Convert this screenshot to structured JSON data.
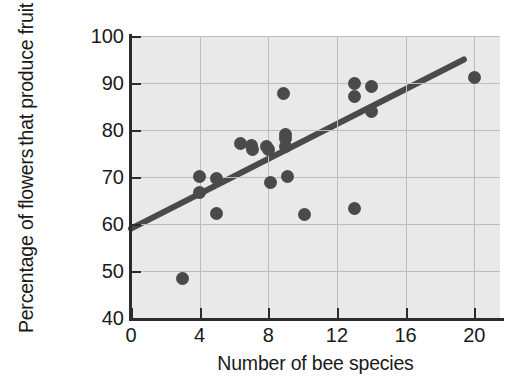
{
  "chart_data": {
    "type": "scatter",
    "title": "",
    "xlabel": "Number of bee species",
    "ylabel_line1": "Percentage of flowers",
    "ylabel_line2": "that produce fruit",
    "xlim": [
      0,
      21.5
    ],
    "ylim": [
      40,
      100
    ],
    "xticks": [
      0,
      4,
      8,
      12,
      16,
      20
    ],
    "yticks": [
      40,
      50,
      60,
      70,
      80,
      90,
      100
    ],
    "xtick_labels": [
      "0",
      "4",
      "8",
      "12",
      "16",
      "20"
    ],
    "ytick_labels": [
      "40",
      "50",
      "60",
      "70",
      "80",
      "90",
      "100"
    ],
    "grid": true,
    "legend": "none",
    "marker_color": "#4a4a4a",
    "plot_background": "#e9e9e9",
    "gridline_color": "#bdbdbd",
    "axis_color": "#2b2b2b",
    "trendline_color": "#4a4a4a",
    "points": [
      {
        "x": 3.0,
        "y": 48.5
      },
      {
        "x": 4.0,
        "y": 70.2
      },
      {
        "x": 4.0,
        "y": 66.6
      },
      {
        "x": 5.0,
        "y": 69.6
      },
      {
        "x": 5.0,
        "y": 62.2
      },
      {
        "x": 6.4,
        "y": 77.1
      },
      {
        "x": 7.0,
        "y": 76.6
      },
      {
        "x": 7.1,
        "y": 75.9
      },
      {
        "x": 7.9,
        "y": 76.4
      },
      {
        "x": 8.0,
        "y": 75.8
      },
      {
        "x": 8.1,
        "y": 68.8
      },
      {
        "x": 8.9,
        "y": 87.8
      },
      {
        "x": 9.0,
        "y": 79.0
      },
      {
        "x": 9.0,
        "y": 78.2
      },
      {
        "x": 9.0,
        "y": 76.5
      },
      {
        "x": 9.1,
        "y": 70.1
      },
      {
        "x": 10.1,
        "y": 62.1
      },
      {
        "x": 13.0,
        "y": 90.0
      },
      {
        "x": 13.0,
        "y": 87.2
      },
      {
        "x": 13.0,
        "y": 63.4
      },
      {
        "x": 14.0,
        "y": 89.2
      },
      {
        "x": 14.0,
        "y": 84.0
      },
      {
        "x": 20.0,
        "y": 91.2
      }
    ],
    "trendline": {
      "label": "fitted line",
      "x_start": 0.0,
      "y_start": 59.0,
      "x_end": 19.4,
      "y_end": 95.0
    }
  }
}
